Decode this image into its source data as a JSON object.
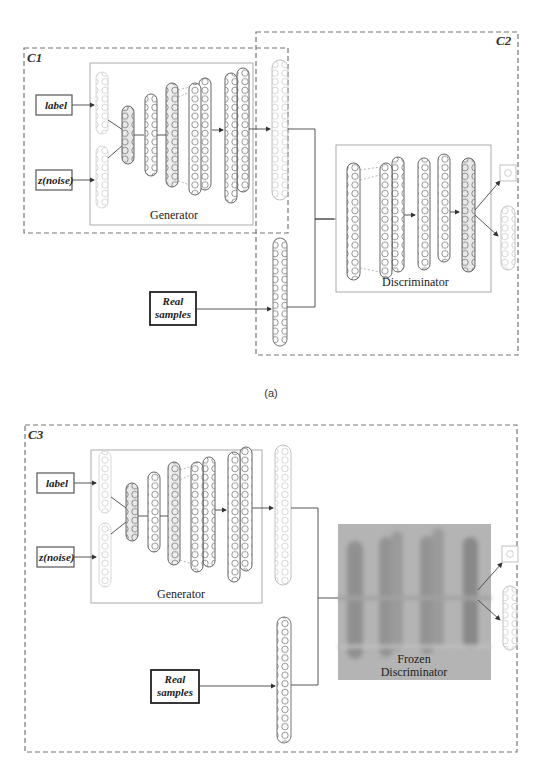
{
  "figure": {
    "top_cutoff_text": "",
    "caption_a": "(a)",
    "colors": {
      "dashed_border": "#777777",
      "layer_stroke": "#555555",
      "layer_fill_gray": "#e6e6e6",
      "faded_layer": "#cfcfcf",
      "frozen_bg": "#b3b3b3",
      "frozen_band": "#8f8f8f"
    }
  },
  "panel_a": {
    "regions": [
      {
        "id": "C1",
        "label": "C1"
      },
      {
        "id": "C2",
        "label": "C2"
      }
    ],
    "inputs": {
      "label": "label",
      "noise": "z(noise)",
      "real": [
        "Real",
        "samples"
      ]
    },
    "generator": {
      "title": "Generator"
    },
    "discriminator": {
      "title": "Discriminator"
    }
  },
  "panel_b": {
    "regions": [
      {
        "id": "C3",
        "label": "C3"
      }
    ],
    "inputs": {
      "label": "label",
      "noise": "z(noise)",
      "real": [
        "Real",
        "samples"
      ]
    },
    "generator": {
      "title": "Generator"
    },
    "discriminator": {
      "title": [
        "Frozen",
        "Discriminator"
      ]
    }
  }
}
